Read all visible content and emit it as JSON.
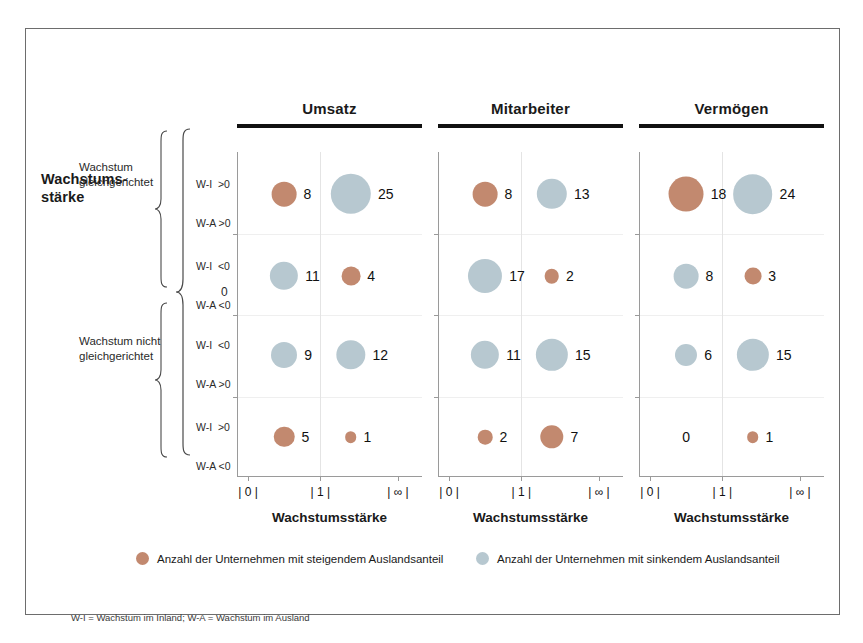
{
  "figure": {
    "axis_group_title": "Wachstums-\nstärke",
    "axis_group_title_line1": "Wachstums-",
    "axis_group_title_line2": "stärke",
    "zero_marker": "0",
    "footnote": "W-I = Wachstum im Inland; W-A = Wachstum im Ausland",
    "colors": {
      "rising": "#c2896f",
      "falling": "#b7c8d0",
      "frame": "#6d6d6d",
      "rule": "#111111",
      "axis": "#9a9a9a",
      "gridline": "#e4e4e4"
    }
  },
  "row_groups": [
    {
      "label_line1": "Wachstum",
      "label_line2": "gleichgerichtet",
      "rows": [
        0,
        1
      ]
    },
    {
      "label_line1": "Wachstum nicht",
      "label_line2": "gleichgerichtet",
      "rows": [
        2,
        3
      ]
    }
  ],
  "rows": [
    {
      "line1": "W-I  >0",
      "line2": "W-A >0"
    },
    {
      "line1": "W-I  <0",
      "line2": "W-A <0"
    },
    {
      "line1": "W-I  <0",
      "line2": "W-A >0"
    },
    {
      "line1": "W-I  >0",
      "line2": "W-A <0"
    }
  ],
  "legend": [
    {
      "key": "rising",
      "color": "#c2896f",
      "label": "Anzahl der Unternehmen mit steigendem Auslandsanteil"
    },
    {
      "key": "falling",
      "color": "#b7c8d0",
      "label": "Anzahl der Unternehmen mit sinkendem Auslandsanteil"
    }
  ],
  "chart_data": {
    "type": "scatter",
    "title": "",
    "xlabel": "Wachstumsstärke",
    "ylabel": "Wachstumsstärke",
    "grid": true,
    "legend_position": "bottom",
    "xticks": [
      "| 0 |",
      "| 1 |",
      "| ∞ |"
    ],
    "x": [
      0.5,
      1.75
    ],
    "ylabels": [
      "W-I >0 / W-A >0",
      "W-I <0 / W-A <0",
      "W-I <0 / W-A >0",
      "W-I >0 / W-A <0"
    ],
    "panels": [
      {
        "name": "Umsatz",
        "title": "Umsatz",
        "xaxis_title": "Wachstumsstärke",
        "points": [
          {
            "row": 0,
            "col": 0,
            "value": 8,
            "series": "rising"
          },
          {
            "row": 0,
            "col": 1,
            "value": 25,
            "series": "falling"
          },
          {
            "row": 1,
            "col": 0,
            "value": 11,
            "series": "falling"
          },
          {
            "row": 1,
            "col": 1,
            "value": 4,
            "series": "rising"
          },
          {
            "row": 2,
            "col": 0,
            "value": 9,
            "series": "falling"
          },
          {
            "row": 2,
            "col": 1,
            "value": 12,
            "series": "falling"
          },
          {
            "row": 3,
            "col": 0,
            "value": 5,
            "series": "rising"
          },
          {
            "row": 3,
            "col": 1,
            "value": 1,
            "series": "rising"
          }
        ]
      },
      {
        "name": "Mitarbeiter",
        "title": "Mitarbeiter",
        "xaxis_title": "Wachstumsstärke",
        "points": [
          {
            "row": 0,
            "col": 0,
            "value": 8,
            "series": "rising"
          },
          {
            "row": 0,
            "col": 1,
            "value": 13,
            "series": "falling"
          },
          {
            "row": 1,
            "col": 0,
            "value": 17,
            "series": "falling"
          },
          {
            "row": 1,
            "col": 1,
            "value": 2,
            "series": "rising"
          },
          {
            "row": 2,
            "col": 0,
            "value": 11,
            "series": "falling"
          },
          {
            "row": 2,
            "col": 1,
            "value": 15,
            "series": "falling"
          },
          {
            "row": 3,
            "col": 0,
            "value": 2,
            "series": "rising"
          },
          {
            "row": 3,
            "col": 1,
            "value": 7,
            "series": "rising"
          }
        ]
      },
      {
        "name": "Vermögen",
        "title": "Vermögen",
        "xaxis_title": "Wachstumsstärke",
        "points": [
          {
            "row": 0,
            "col": 0,
            "value": 18,
            "series": "rising"
          },
          {
            "row": 0,
            "col": 1,
            "value": 24,
            "series": "falling"
          },
          {
            "row": 1,
            "col": 0,
            "value": 8,
            "series": "falling"
          },
          {
            "row": 1,
            "col": 1,
            "value": 3,
            "series": "rising"
          },
          {
            "row": 2,
            "col": 0,
            "value": 6,
            "series": "falling"
          },
          {
            "row": 2,
            "col": 1,
            "value": 15,
            "series": "falling"
          },
          {
            "row": 3,
            "col": 0,
            "value": 0,
            "series": "rising"
          },
          {
            "row": 3,
            "col": 1,
            "value": 1,
            "series": "rising"
          }
        ]
      }
    ]
  }
}
